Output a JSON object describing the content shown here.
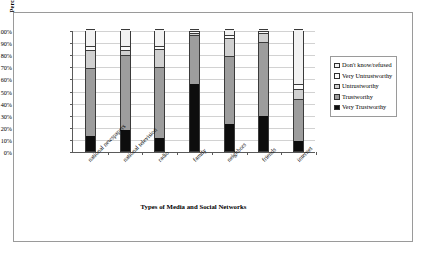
{
  "chart_data": {
    "type": "bar",
    "subtype": "100% stacked column",
    "title": "",
    "xlabel": "Types of Media and Social Networks",
    "ylabel": "Percentage of Respondents",
    "ylim": [
      0,
      100
    ],
    "ytick_labels": [
      "100%",
      "90%",
      "80%",
      "70%",
      "60%",
      "50%",
      "40%",
      "30%",
      "20%",
      "10%",
      "0%"
    ],
    "ytick_values": [
      100,
      90,
      80,
      70,
      60,
      50,
      40,
      30,
      20,
      10,
      0
    ],
    "grid": true,
    "legend_position": "right",
    "categories": [
      "national newspapers",
      "national television",
      "radio",
      "family",
      "neighbors",
      "friends",
      "internet"
    ],
    "series": [
      {
        "name": "Very Trustworthy",
        "color": "#0d0d0d",
        "values": [
          12,
          17,
          11,
          55,
          22,
          29,
          8
        ]
      },
      {
        "name": "Trustworthy",
        "color": "#9d9d9d",
        "values": [
          56,
          62,
          58,
          40,
          56,
          60,
          35
        ]
      },
      {
        "name": "Untrustworthy",
        "color": "#d0d0d0",
        "values": [
          15,
          4,
          15,
          2,
          15,
          8,
          8
        ]
      },
      {
        "name": "Very Untrustworthy",
        "color": "#fbfbfb",
        "values": [
          3,
          3,
          2,
          1,
          2,
          1,
          4
        ]
      },
      {
        "name": "Don't know/refused",
        "color": "#f2f2f2",
        "values": [
          14,
          14,
          14,
          2,
          5,
          2,
          45
        ]
      }
    ]
  },
  "legend": {
    "items": [
      {
        "label": "Don't know/refused",
        "color": "#f2f2f2"
      },
      {
        "label": "Very Untrustworthy",
        "color": "#fbfbfb"
      },
      {
        "label": "Untrustworthy",
        "color": "#d0d0d0"
      },
      {
        "label": "Trustworthy",
        "color": "#9d9d9d"
      },
      {
        "label": "Very Trustworthy",
        "color": "#0d0d0d"
      }
    ]
  }
}
